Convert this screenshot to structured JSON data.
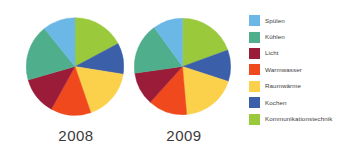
{
  "chart_data": {
    "type": "pie",
    "title": "",
    "categories": [
      "Spülen",
      "Kühlen",
      "Licht",
      "Warmwasser",
      "Raumwärme",
      "Kochen",
      "Kommunikationstechnik"
    ],
    "colors": [
      "#6BB7E6",
      "#4FAE8B",
      "#9B1C38",
      "#F0491E",
      "#FBD04B",
      "#3B5FA8",
      "#9ACA3C"
    ],
    "legend_position": "right",
    "grid": false,
    "series": [
      {
        "name": "2008",
        "values": [
          10.8,
          18.6,
          12.5,
          13.3,
          17.2,
          10.3,
          17.3
        ],
        "angles_deg": [
          39,
          67,
          45,
          48,
          62,
          37,
          62
        ]
      },
      {
        "name": "2009",
        "values": [
          10.0,
          17.2,
          11.1,
          13.1,
          18.6,
          10.6,
          19.4
        ],
        "angles_deg": [
          36,
          62,
          40,
          47,
          67,
          38,
          70
        ]
      }
    ]
  },
  "pies": [
    {
      "id": "pie-2008",
      "year_label": "2008"
    },
    {
      "id": "pie-2009",
      "year_label": "2009"
    }
  ],
  "legend": {
    "items": [
      {
        "label": "Spülen",
        "color": "#6BB7E6"
      },
      {
        "label": "Kühlen",
        "color": "#4FAE8B"
      },
      {
        "label": "Licht",
        "color": "#9B1C38"
      },
      {
        "label": "Warmwasser",
        "color": "#F0491E"
      },
      {
        "label": "Raumwärme",
        "color": "#FBD04B"
      },
      {
        "label": "Kochen",
        "color": "#3B5FA8"
      },
      {
        "label": "Kommunikationstechnik",
        "color": "#9ACA3C"
      }
    ]
  }
}
